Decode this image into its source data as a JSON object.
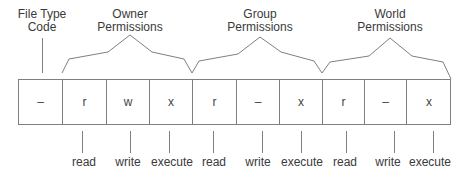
{
  "diagram": {
    "title_labels": {
      "file_type": [
        "File Type",
        "Code"
      ],
      "owner": [
        "Owner",
        "Permissions"
      ],
      "group": [
        "Group",
        "Permissions"
      ],
      "world": [
        "World",
        "Permissions"
      ]
    },
    "cells": [
      "–",
      "r",
      "w",
      "x",
      "r",
      "–",
      "x",
      "r",
      "–",
      "x"
    ],
    "bottom_labels": [
      "read",
      "write",
      "execute",
      "read",
      "write",
      "execute",
      "read",
      "write",
      "execute"
    ],
    "colors": {
      "line": "#7a7a7a",
      "text": "#3a3a3a"
    }
  }
}
